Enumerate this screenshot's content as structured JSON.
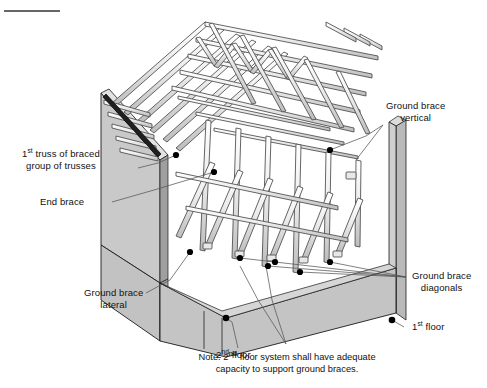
{
  "figure": {
    "top_rule": "horizontal-rule",
    "colors": {
      "wall_light": "#c9c9c9",
      "wall_mid": "#bdbdbd",
      "wall_dark": "#a8a8a8",
      "floor": "#c4c4c4",
      "member_fill": "#f2f2f2",
      "member_stroke": "#4a4a4a",
      "outline": "#1a1a1a",
      "leader": "#555555",
      "dot": "#000000",
      "text": "#111111"
    }
  },
  "labels": {
    "first_truss": {
      "line1_pre": "1",
      "line1_sup": "st",
      "line1_post": " truss of braced",
      "line2": "group of trusses"
    },
    "end_brace": "End brace",
    "ground_brace_vertical": {
      "line1": "Ground brace",
      "line2": "vertical"
    },
    "ground_brace_diagonals": {
      "line1": "Ground brace",
      "line2": "diagonals"
    },
    "ground_brace_lateral": {
      "line1": "Ground brace",
      "line2": "lateral"
    },
    "second_floor": {
      "pre": "2",
      "sup": "nd",
      "post": " floor"
    },
    "first_floor": {
      "pre": "1",
      "sup": "st",
      "post": " floor"
    },
    "note": {
      "line1_pre": "Note: 2",
      "line1_sup": "nd",
      "line1_post": " floor system shall have adequate",
      "line2": "capacity to support ground braces."
    }
  }
}
